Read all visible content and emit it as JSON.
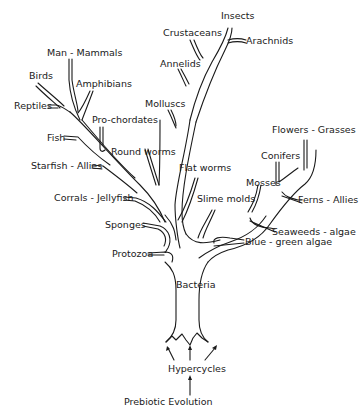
{
  "diagram": {
    "type": "tree-of-life",
    "root": {
      "prebiotic": "Prebiotic Evolution",
      "hypercycles": "Hypercycles",
      "trunk": "Bacteria"
    },
    "left_branches": {
      "protozoa": "Protozoa",
      "sponges": "Sponges",
      "corals": "Corrals - Jellyfish",
      "starfish": "Starfish - Allies",
      "fish": "Fish",
      "reptiles": "Reptiles",
      "birds": "Birds",
      "mammals": "Man - Mammals",
      "amphibians": "Amphibians",
      "prochordates": "Pro-chordates",
      "roundworms": "Round worms"
    },
    "center_branches": {
      "molluscs": "Molluscs",
      "annelids": "Annelids",
      "crustaceans": "Crustaceans",
      "insects": "Insects",
      "arachnids": "Arachnids",
      "flatworms": "Flat   worms",
      "slimemolds": "Slime molds"
    },
    "right_branches": {
      "bluegreen": "Blue - green algae",
      "seaweeds": "Seaweeds - algae",
      "mosses": "Mosses",
      "ferns": "Ferns - Allies",
      "conifers": "Conifers",
      "flowers": "Flowers - Grasses"
    }
  }
}
